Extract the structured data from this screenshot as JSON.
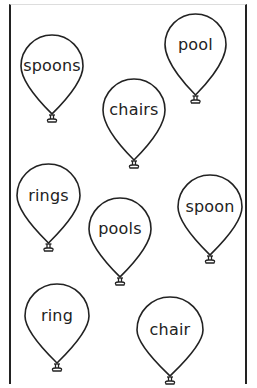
{
  "header": {
    "instruction_text": ""
  },
  "balloons": [
    {
      "word": "spoons",
      "x": 20,
      "y": 34,
      "w": 64,
      "h": 80
    },
    {
      "word": "pool",
      "x": 164,
      "y": 13,
      "w": 63,
      "h": 82
    },
    {
      "word": "chairs",
      "x": 102,
      "y": 78,
      "w": 64,
      "h": 82
    },
    {
      "word": "rings",
      "x": 16,
      "y": 163,
      "w": 65,
      "h": 80
    },
    {
      "word": "spoon",
      "x": 177,
      "y": 174,
      "w": 66,
      "h": 81
    },
    {
      "word": "pools",
      "x": 88,
      "y": 197,
      "w": 64,
      "h": 80
    },
    {
      "word": "ring",
      "x": 24,
      "y": 283,
      "w": 66,
      "h": 80
    },
    {
      "word": "chair",
      "x": 136,
      "y": 296,
      "w": 68,
      "h": 80
    }
  ],
  "colors": {
    "stroke": "#222222",
    "background": "#ffffff"
  }
}
